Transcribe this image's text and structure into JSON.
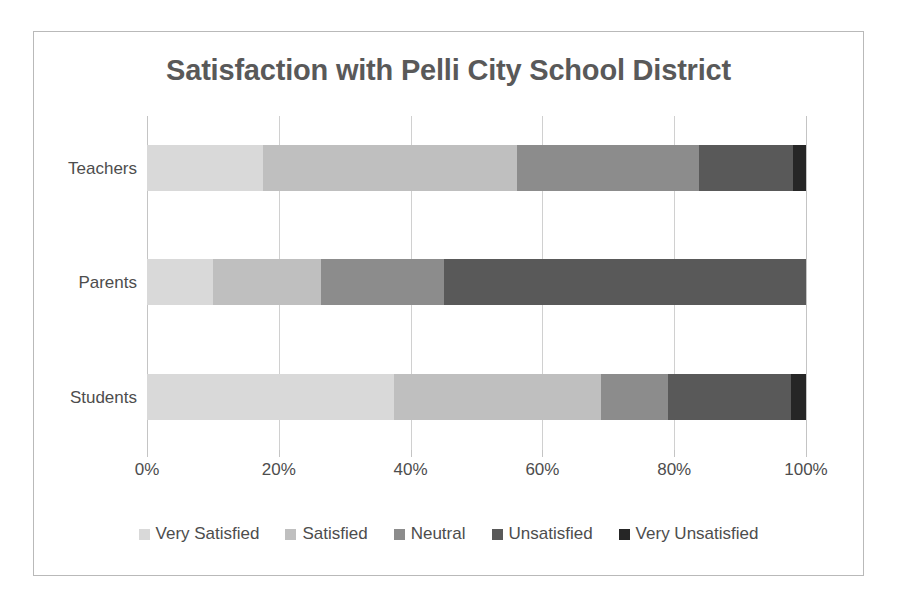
{
  "chart_data": {
    "type": "bar",
    "subtype": "stacked-horizontal-100pct",
    "title": "Satisfaction with Pelli City School District",
    "xlabel": "",
    "ylabel": "",
    "xlim": [
      0,
      100
    ],
    "x_ticks": [
      "0%",
      "20%",
      "40%",
      "60%",
      "80%",
      "100%"
    ],
    "x_tick_values": [
      0,
      20,
      40,
      60,
      80,
      100
    ],
    "grid": true,
    "legend_position": "bottom",
    "categories": [
      "Teachers",
      "Parents",
      "Students"
    ],
    "series": [
      {
        "name": "Very Satisfied",
        "color": "#d9d9d9",
        "values": [
          17.6,
          10.0,
          37.5
        ]
      },
      {
        "name": "Satisfied",
        "color": "#bfbfbf",
        "values": [
          38.5,
          16.4,
          31.4
        ]
      },
      {
        "name": "Neutral",
        "color": "#8c8c8c",
        "values": [
          27.6,
          18.6,
          10.2
        ]
      },
      {
        "name": "Unsatisfied",
        "color": "#595959",
        "values": [
          14.3,
          55.0,
          18.7
        ]
      },
      {
        "name": "Very Unsatisfied",
        "color": "#262626",
        "values": [
          2.0,
          0.0,
          2.2
        ]
      }
    ]
  },
  "colors": {
    "title_text": "#595959",
    "axis_text": "#4d4d4d",
    "gridline": "#d0d0d0",
    "frame_border": "#b9b9b9",
    "background": "#ffffff"
  }
}
